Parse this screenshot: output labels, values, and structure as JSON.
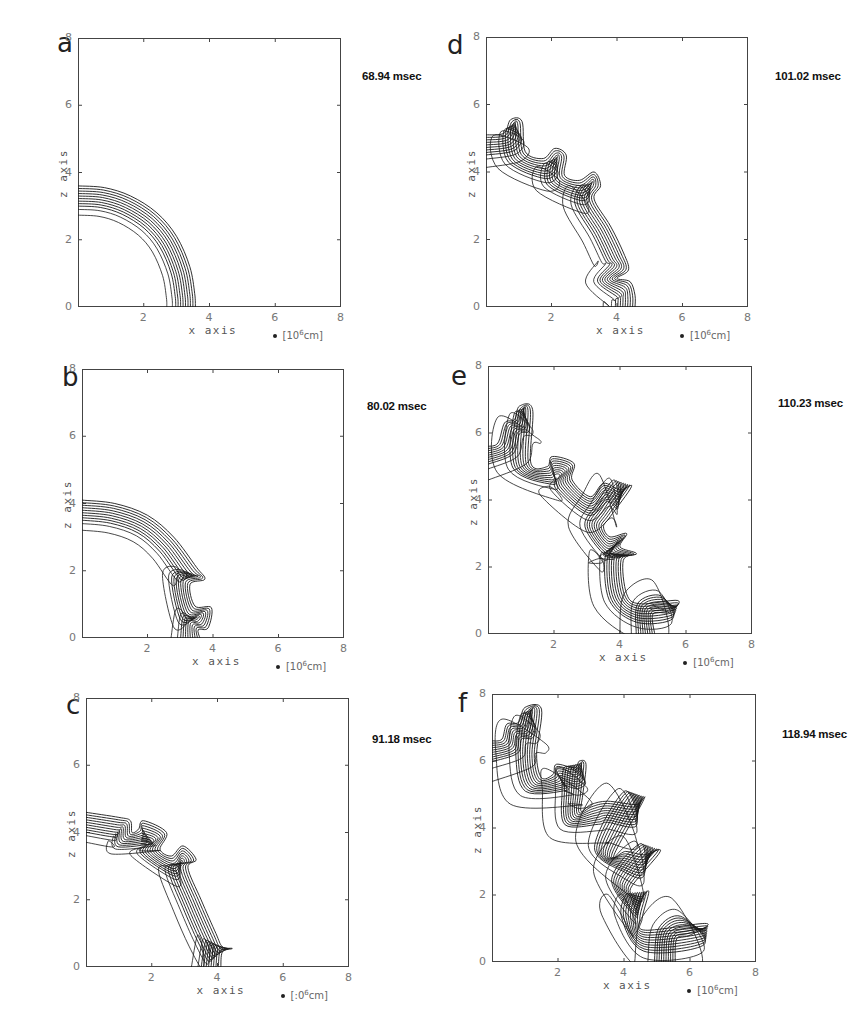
{
  "figure": {
    "panels": [
      {
        "id": "a",
        "letter": "a",
        "time_label": "68.94 msec",
        "frame": {
          "left": 78,
          "top": 38,
          "right": 341,
          "bottom": 307
        },
        "letter_pos": {
          "x": 57,
          "y": 30
        },
        "time_pos": {
          "x": 362,
          "y": 70
        },
        "xlabel": "x axis",
        "zlabel": "z axis",
        "unit": {
          "pre": "[10",
          "exp": "6",
          "post": "cm]"
        },
        "contours": {
          "count": 9,
          "spacing": 0.075,
          "outer_extra": [
            0.17,
            0.1
          ],
          "path": [
            [
              0,
              3.6
            ],
            [
              0.8,
              3.55
            ],
            [
              1.6,
              3.3
            ],
            [
              2.4,
              2.8
            ],
            [
              3.0,
              2.1
            ],
            [
              3.4,
              1.2
            ],
            [
              3.55,
              0.4
            ],
            [
              3.57,
              0
            ]
          ]
        }
      },
      {
        "id": "b",
        "letter": "b",
        "time_label": "80.02 msec",
        "frame": {
          "left": 82,
          "top": 369,
          "right": 344,
          "bottom": 638
        },
        "letter_pos": {
          "x": 62,
          "y": 364
        },
        "time_pos": {
          "x": 367,
          "y": 400
        },
        "xlabel": "x axis",
        "zlabel": "z axis",
        "unit": {
          "pre": "[10",
          "exp": "6",
          "post": "cm]"
        },
        "contours": {
          "count": 9,
          "spacing": 0.075,
          "outer_extra": [
            0.2,
            0.1
          ],
          "path": [
            [
              0,
              4.1
            ],
            [
              1.0,
              4.0
            ],
            [
              2.0,
              3.65
            ],
            [
              2.8,
              3.0
            ],
            [
              3.5,
              2.1
            ],
            [
              3.75,
              1.75
            ],
            [
              3.3,
              1.6
            ],
            [
              3.45,
              0.95
            ],
            [
              3.95,
              0.9
            ],
            [
              3.85,
              0.3
            ],
            [
              3.55,
              0.25
            ],
            [
              3.6,
              0
            ]
          ]
        }
      },
      {
        "id": "c",
        "letter": "c",
        "time_label": "91.18 msec",
        "frame": {
          "left": 86,
          "top": 698,
          "right": 349,
          "bottom": 967
        },
        "letter_pos": {
          "x": 66,
          "y": 692
        },
        "time_pos": {
          "x": 372,
          "y": 733
        },
        "xlabel": "x axis",
        "zlabel": "z axis",
        "unit": {
          "pre": "[:0",
          "exp": "6",
          "post": "cm]"
        },
        "contours": {
          "count": 9,
          "spacing": 0.075,
          "outer_extra": [
            0.2,
            0.1
          ],
          "path": [
            [
              0,
              4.6
            ],
            [
              1.0,
              4.45
            ],
            [
              1.35,
              4.35
            ],
            [
              1.4,
              4.0
            ],
            [
              1.6,
              4.1
            ],
            [
              1.75,
              4.35
            ],
            [
              2.45,
              4.0
            ],
            [
              2.25,
              3.5
            ],
            [
              2.6,
              3.3
            ],
            [
              2.95,
              3.6
            ],
            [
              3.35,
              3.2
            ],
            [
              3.1,
              2.95
            ],
            [
              3.5,
              2.0
            ],
            [
              3.95,
              1.0
            ],
            [
              4.15,
              0.6
            ],
            [
              4.45,
              0.55
            ],
            [
              4.15,
              0.45
            ],
            [
              4.1,
              0
            ]
          ]
        }
      },
      {
        "id": "d",
        "letter": "d",
        "time_label": "101.02 msec",
        "frame": {
          "left": 486,
          "top": 37,
          "right": 748,
          "bottom": 307
        },
        "letter_pos": {
          "x": 447,
          "y": 32
        },
        "time_pos": {
          "x": 775,
          "y": 70
        },
        "xlabel": "x axis",
        "zlabel": "z axis",
        "unit": {
          "pre": "[10",
          "exp": "6",
          "post": "cm]"
        },
        "contours": {
          "count": 9,
          "spacing": 0.075,
          "outer_extra": [
            0.25,
            0.12
          ],
          "path": [
            [
              0,
              5.1
            ],
            [
              0.55,
              5.15
            ],
            [
              0.75,
              5.55
            ],
            [
              1.1,
              5.5
            ],
            [
              1.2,
              4.6
            ],
            [
              1.75,
              4.4
            ],
            [
              2.1,
              4.7
            ],
            [
              2.45,
              4.5
            ],
            [
              2.4,
              3.9
            ],
            [
              2.85,
              3.75
            ],
            [
              3.3,
              4.0
            ],
            [
              3.5,
              3.6
            ],
            [
              3.3,
              3.2
            ],
            [
              3.8,
              2.4
            ],
            [
              4.2,
              1.6
            ],
            [
              4.35,
              1.1
            ],
            [
              4.0,
              0.85
            ],
            [
              4.4,
              0.75
            ],
            [
              4.55,
              0.35
            ],
            [
              4.55,
              0
            ]
          ]
        }
      },
      {
        "id": "e",
        "letter": "e",
        "time_label": "110.23 msec",
        "frame": {
          "left": 488,
          "top": 366,
          "right": 752,
          "bottom": 634
        },
        "letter_pos": {
          "x": 451,
          "y": 363
        },
        "time_pos": {
          "x": 778,
          "y": 397
        },
        "xlabel": "x axis",
        "zlabel": "z axis",
        "unit": {
          "pre": "[10",
          "exp": "6",
          "post": "cm]"
        },
        "contours": {
          "count": 9,
          "spacing": 0.07,
          "outer_extra": [
            0.35,
            0.15
          ],
          "path": [
            [
              0,
              5.6
            ],
            [
              0.3,
              5.7
            ],
            [
              0.5,
              6.3
            ],
            [
              0.8,
              6.4
            ],
            [
              0.95,
              6.8
            ],
            [
              1.35,
              6.7
            ],
            [
              1.3,
              5.1
            ],
            [
              1.8,
              5.0
            ],
            [
              1.95,
              5.3
            ],
            [
              2.6,
              5.1
            ],
            [
              2.55,
              4.6
            ],
            [
              3.1,
              4.1
            ],
            [
              3.5,
              4.5
            ],
            [
              4.0,
              4.3
            ],
            [
              4.35,
              4.4
            ],
            [
              3.7,
              3.5
            ],
            [
              3.5,
              3.2
            ],
            [
              3.7,
              2.9
            ],
            [
              4.2,
              3.0
            ],
            [
              4.0,
              2.6
            ],
            [
              4.5,
              2.4
            ],
            [
              4.1,
              2.2
            ],
            [
              4.2,
              1.2
            ],
            [
              4.6,
              0.9
            ],
            [
              5.75,
              1.0
            ],
            [
              5.5,
              0.65
            ],
            [
              5.0,
              0.6
            ],
            [
              5.05,
              0
            ]
          ]
        }
      },
      {
        "id": "f",
        "letter": "f",
        "time_label": "118.94 msec",
        "frame": {
          "left": 492,
          "top": 694,
          "right": 756,
          "bottom": 962
        },
        "letter_pos": {
          "x": 458,
          "y": 690
        },
        "time_pos": {
          "x": 782,
          "y": 728
        },
        "xlabel": "x axis",
        "zlabel": "z axis",
        "unit": {
          "pre": "[10",
          "exp": "6",
          "post": "cm]"
        },
        "contours": {
          "count": 10,
          "spacing": 0.07,
          "outer_extra": [
            0.4,
            0.2
          ],
          "path": [
            [
              0,
              6.6
            ],
            [
              0.3,
              6.65
            ],
            [
              0.45,
              7.1
            ],
            [
              0.8,
              7.15
            ],
            [
              1.0,
              7.6
            ],
            [
              1.5,
              7.55
            ],
            [
              1.35,
              6.2
            ],
            [
              1.5,
              5.5
            ],
            [
              1.85,
              5.6
            ],
            [
              1.95,
              5.9
            ],
            [
              2.5,
              5.8
            ],
            [
              2.65,
              6.0
            ],
            [
              2.85,
              5.9
            ],
            [
              2.75,
              5.0
            ],
            [
              2.7,
              4.5
            ],
            [
              3.0,
              4.7
            ],
            [
              3.5,
              4.8
            ],
            [
              4.35,
              4.7
            ],
            [
              4.6,
              4.85
            ],
            [
              3.7,
              3.2
            ],
            [
              4.05,
              3.3
            ],
            [
              4.6,
              3.2
            ],
            [
              5.1,
              3.3
            ],
            [
              4.2,
              2.2
            ],
            [
              4.5,
              1.95
            ],
            [
              4.75,
              2.1
            ],
            [
              4.55,
              1.3
            ],
            [
              4.65,
              0.95
            ],
            [
              6.5,
              1.15
            ],
            [
              6.0,
              0.8
            ],
            [
              5.6,
              0.7
            ],
            [
              5.55,
              0
            ]
          ]
        }
      }
    ],
    "axis": {
      "min": 0,
      "max": 8,
      "ticks": [
        "0",
        "2",
        "4",
        "6",
        "8"
      ]
    }
  },
  "chart_data": [
    {
      "type": "line",
      "panel": "a",
      "title": "68.94 msec",
      "xlabel": "x axis",
      "ylabel": "z axis",
      "unit": "10^6 cm",
      "xlim": [
        0,
        8
      ],
      "ylim": [
        0,
        8
      ],
      "xticks": [
        0,
        2,
        4,
        6,
        8
      ],
      "yticks": [
        0,
        2,
        4,
        6,
        8
      ],
      "description": "Smooth quarter-circle flame front contours, inner radius ~3.55, outer ~4.1"
    },
    {
      "type": "line",
      "panel": "b",
      "title": "80.02 msec",
      "xlabel": "x axis",
      "ylabel": "z axis",
      "unit": "10^6 cm",
      "xlim": [
        0,
        8
      ],
      "ylim": [
        0,
        8
      ],
      "xticks": [
        0,
        2,
        4,
        6,
        8
      ],
      "yticks": [
        0,
        2,
        4,
        6,
        8
      ],
      "description": "Front radius ~4.1-4.8 on z axis, instabilities developing near z<2, x~3.5-4.3"
    },
    {
      "type": "line",
      "panel": "c",
      "title": "91.18 msec",
      "xlabel": "x axis",
      "ylabel": "z axis",
      "unit": "10^6 cm",
      "xlim": [
        0,
        8
      ],
      "ylim": [
        0,
        8
      ],
      "xticks": [
        0,
        2,
        4,
        6,
        8
      ],
      "yticks": [
        0,
        2,
        4,
        6,
        8
      ],
      "description": "Front z-intercept ~4.6-5.3, x-intercept ~4.1-4.7, wrinkles along front"
    },
    {
      "type": "line",
      "panel": "d",
      "title": "101.02 msec",
      "xlabel": "x axis",
      "ylabel": "z axis",
      "unit": "10^6 cm",
      "xlim": [
        0,
        8
      ],
      "ylim": [
        0,
        8
      ],
      "xticks": [
        0,
        2,
        4,
        6,
        8
      ],
      "yticks": [
        0,
        2,
        4,
        6,
        8
      ],
      "description": "Front z-intercept ~5.1-5.9, x-intercept ~4.55-5.2, growing wrinkles"
    },
    {
      "type": "line",
      "panel": "e",
      "title": "110.23 msec",
      "xlabel": "x axis",
      "ylabel": "z axis",
      "unit": "10^6 cm",
      "xlim": [
        0,
        8
      ],
      "ylim": [
        0,
        8
      ],
      "xticks": [
        0,
        2,
        4,
        6,
        8
      ],
      "yticks": [
        0,
        2,
        4,
        6,
        8
      ],
      "description": "Strongly wrinkled front, z-intercept ~5.6-6.7, x-intercept ~5.0-5.9"
    },
    {
      "type": "line",
      "panel": "f",
      "title": "118.94 msec",
      "xlabel": "x axis",
      "ylabel": "z axis",
      "unit": "10^6 cm",
      "xlim": [
        0,
        8
      ],
      "ylim": [
        0,
        8
      ],
      "xticks": [
        0,
        2,
        4,
        6,
        8
      ],
      "yticks": [
        0,
        2,
        4,
        6,
        8
      ],
      "description": "Highly convoluted front, z-intercept ~6.6-7.7, x-intercept ~5.5-6.5"
    }
  ]
}
